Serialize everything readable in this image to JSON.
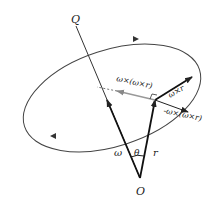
{
  "diagram": {
    "labels": {
      "axis_point": "Q",
      "origin": "O",
      "angle": "θ",
      "omega": "ω",
      "r": "r",
      "omega_cross_r": "ω×r",
      "omega_cross_omega_cross_r": "ω×(ω×r)",
      "neg_omega_cross_omega_cross_r": "-ω×(ω×r)"
    },
    "colors": {
      "line": "#222222",
      "gray_arrow": "#999999",
      "ellipse": "#444444"
    }
  }
}
